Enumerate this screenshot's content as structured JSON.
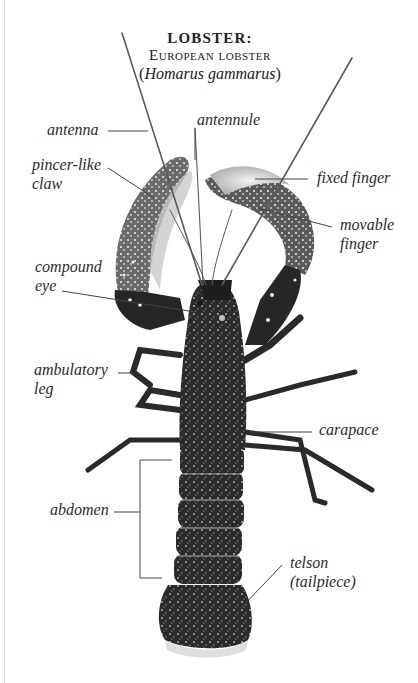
{
  "title": {
    "heading": "LOBSTER:",
    "common_name": "European lobster",
    "latin_open": "(",
    "latin_name": "Homarus gammarus",
    "latin_close": ")"
  },
  "labels": {
    "antenna": "antenna",
    "antennule": "antennule",
    "pincer_claw_line1": "pincer-like",
    "pincer_claw_line2": "claw",
    "fixed_finger": "fixed finger",
    "movable_finger_line1": "movable",
    "movable_finger_line2": "finger",
    "compound_eye_line1": "compound",
    "compound_eye_line2": "eye",
    "ambulatory_leg_line1": "ambulatory",
    "ambulatory_leg_line2": "leg",
    "carapace": "carapace",
    "abdomen": "abdomen",
    "telson_line1": "telson",
    "telson_line2": "(tailpiece)"
  },
  "colors": {
    "background": "#ffffff",
    "text": "#2b2b2b",
    "leader_line": "#444444",
    "body_dark": "#1a1a1a",
    "claw_speckle": "#3a3a3a",
    "antenna": "#555555"
  }
}
